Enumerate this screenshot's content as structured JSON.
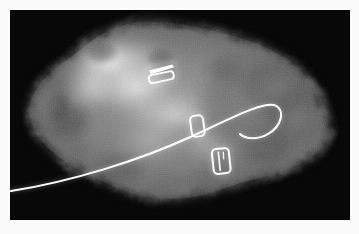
{
  "image": {
    "kind": "specimen-radiograph",
    "modality_label": "mammographic specimen radiograph",
    "width": 359,
    "height": 234,
    "background_color": "#ffffff",
    "frame_color": "#fbfbfb",
    "exposure_field_color": "#060606"
  },
  "plate": {
    "x": 10,
    "y": 10,
    "width": 340,
    "height": 210
  },
  "tissue": {
    "label": "soft-tissue specimen",
    "description": "irregular lobulated breast tissue specimen occupying the central and left portion of the exposure field",
    "dense_region_label": "dense fibroglandular region",
    "dense_region_center": [
      120,
      70
    ],
    "mid_gray": "#8d8d8d",
    "bright_gray": "#ededed",
    "dim_gray": "#4a4a4a"
  },
  "markers": {
    "color": "#ffffff",
    "items": [
      {
        "id": "clip-1",
        "label": "ribbon-clip-upper",
        "type": "ribbon",
        "cx": 150,
        "cy": 68,
        "w": 26,
        "h": 16,
        "rotation": -12
      },
      {
        "id": "clip-2",
        "label": "rectangular-clip-middle",
        "type": "ring",
        "cx": 186,
        "cy": 117,
        "w": 13,
        "h": 21,
        "rotation": -8
      },
      {
        "id": "clip-3",
        "label": "barrel-clip-lower",
        "type": "barred-ring",
        "cx": 210,
        "cy": 152,
        "w": 17,
        "h": 25,
        "rotation": -6
      }
    ]
  },
  "wire": {
    "label": "localization-hookwire",
    "color": "#ffffff",
    "stroke_width": 2,
    "entry_point": [
      11,
      191
    ],
    "hook_apex": [
      272,
      105
    ],
    "hook_tip": [
      240,
      135
    ],
    "path": "M 1 181 C 60 172, 130 150, 178 128 C 222 108, 252 92, 264 95 C 276 99, 272 116, 258 124 C 246 131, 234 128, 230 124"
  },
  "overlays": {
    "text_annotations": [],
    "visible_labels": []
  }
}
